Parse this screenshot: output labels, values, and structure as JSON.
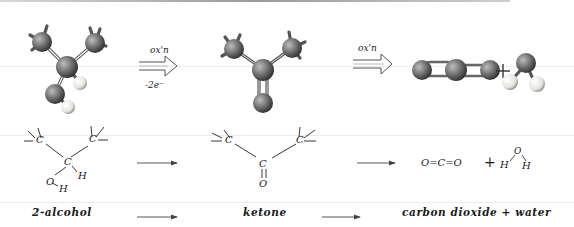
{
  "diagram": {
    "steps": [
      {
        "id": "alcohol",
        "model": "ball-and-stick 2-propanol",
        "formula_atoms": [
          "C",
          "C",
          "C",
          "H",
          "O",
          "H"
        ],
        "name": "2-alcohol"
      },
      {
        "id": "ketone",
        "model": "ball-and-stick acetone",
        "formula_atoms": [
          "C",
          "C",
          "C",
          "O"
        ],
        "name": "ketone"
      },
      {
        "id": "products",
        "model": "ball-and-stick CO2 + H2O",
        "formula": {
          "co2": "O=C=O",
          "plus": "+",
          "water_o": "O",
          "water_h1": "H",
          "water_h2": "H"
        },
        "name": "carbon dioxide + water"
      }
    ],
    "arrows": {
      "model_arrow_1": {
        "top_label": "ox'n",
        "bottom_label": "-2e⁻"
      },
      "model_arrow_2": {
        "top_label": "ox'n"
      },
      "plus_sign": "+"
    },
    "atom_labels": {
      "carbon": "C",
      "hydrogen": "H",
      "oxygen": "O"
    },
    "colors": {
      "ink": "#1a1a1a",
      "carbon_ball": "#6e6e6e",
      "hydrogen_ball": "#e8e8e2",
      "background": "#ffffff"
    }
  }
}
